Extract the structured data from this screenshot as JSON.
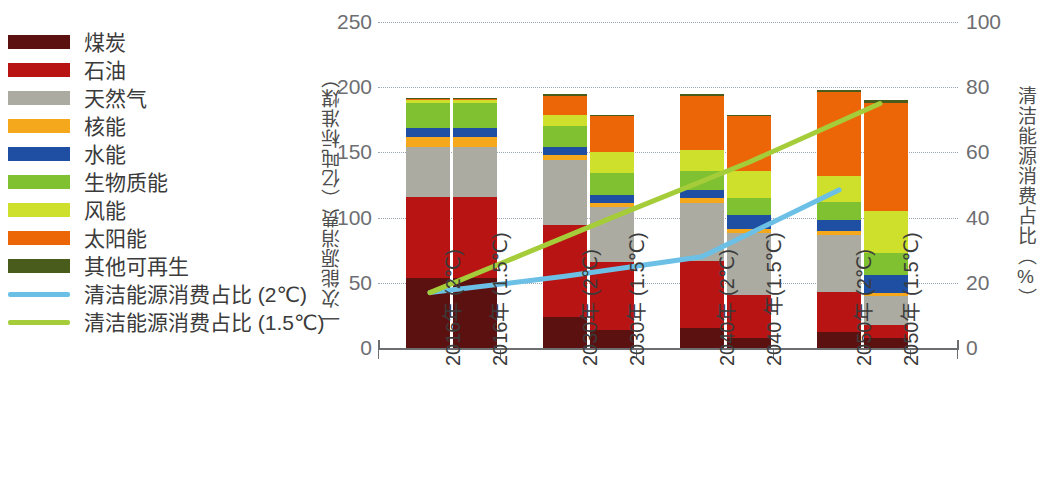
{
  "legend": {
    "items": [
      {
        "label": "煤炭",
        "color": "#5c1111",
        "type": "box"
      },
      {
        "label": "石油",
        "color": "#b81414",
        "type": "box"
      },
      {
        "label": "天然气",
        "color": "#ababa2",
        "type": "box"
      },
      {
        "label": "核能",
        "color": "#f5a81c",
        "type": "box"
      },
      {
        "label": "水能",
        "color": "#1f4fa3",
        "type": "box"
      },
      {
        "label": "生物质能",
        "color": "#7fc131",
        "type": "box"
      },
      {
        "label": "风能",
        "color": "#cfe02c",
        "type": "box"
      },
      {
        "label": "太阳能",
        "color": "#ec6608",
        "type": "box"
      },
      {
        "label": "其他可再生",
        "color": "#4a5c1b",
        "type": "box"
      },
      {
        "label": "清洁能源消费占比 (2℃)",
        "color": "#6cc0e5",
        "type": "line"
      },
      {
        "label": "清洁能源消费占比 (1.5℃)",
        "color": "#a5cd39",
        "type": "line"
      }
    ]
  },
  "chart_data": {
    "type": "bar",
    "title": "",
    "xlabel": "",
    "ylabel": "一次能源消费（亿吨标准煤）",
    "y2label": "清洁能源消费占比（%）",
    "ylim": [
      0,
      250
    ],
    "y2lim": [
      0,
      100
    ],
    "yticks": [
      "0",
      "50",
      "100",
      "150",
      "200",
      "250"
    ],
    "y2ticks": [
      "0",
      "20",
      "40",
      "60",
      "80",
      "100"
    ],
    "grid": true,
    "legend_position": "left-outside",
    "categories": [
      "2016年 (2℃)",
      "2016年 (1.5℃)",
      "2030年 (2℃)",
      "2030年 (1.5℃)",
      "2040年 (2℃)",
      "2040 年(1.5℃)",
      "2050年 (2℃)",
      "2050年 (1.5℃)"
    ],
    "series": [
      {
        "name": "煤炭",
        "color": "#5c1111",
        "values": [
          54,
          54,
          24,
          14,
          15,
          8,
          12,
          8
        ]
      },
      {
        "name": "石油",
        "color": "#b81414",
        "values": [
          62,
          62,
          70,
          52,
          52,
          33,
          31,
          10
        ]
      },
      {
        "name": "天然气",
        "color": "#ababa2",
        "values": [
          38,
          38,
          50,
          42,
          44,
          47,
          44,
          22
        ]
      },
      {
        "name": "核能",
        "color": "#f5a81c",
        "values": [
          8,
          8,
          4,
          3,
          4,
          3,
          3,
          2
        ]
      },
      {
        "name": "水能",
        "color": "#1f4fa3",
        "values": [
          7,
          7,
          6,
          6,
          6,
          11,
          8,
          14
        ]
      },
      {
        "name": "生物质能",
        "color": "#7fc131",
        "values": [
          19,
          19,
          16,
          17,
          15,
          13,
          14,
          17
        ]
      },
      {
        "name": "风能",
        "color": "#cfe02c",
        "values": [
          2,
          2,
          9,
          16,
          16,
          21,
          20,
          32
        ]
      },
      {
        "name": "太阳能",
        "color": "#ec6608",
        "values": [
          1,
          1,
          14,
          28,
          41,
          42,
          64,
          83
        ]
      },
      {
        "name": "其他可再生",
        "color": "#4a5c1b",
        "values": [
          1,
          1,
          2,
          1,
          2,
          1,
          2,
          2
        ]
      }
    ],
    "lines": [
      {
        "name": "清洁能源消费占比 (2℃)",
        "color": "#6cc0e5",
        "axis": "right",
        "x_categories": [
          "2016年 (2℃)",
          "2030年 (2℃)",
          "2040年 (2℃)",
          "2050年 (2℃)"
        ],
        "values": [
          17,
          22,
          28,
          48.5
        ]
      },
      {
        "name": "清洁能源消费占比 (1.5℃)",
        "color": "#a5cd39",
        "axis": "right",
        "x_categories": [
          "2016年 (1.5℃)",
          "2030年 (1.5℃)",
          "2040年 (1.5℃)",
          "2050年 (1.5℃)"
        ],
        "values": [
          17,
          40,
          57,
          75
        ]
      }
    ]
  }
}
